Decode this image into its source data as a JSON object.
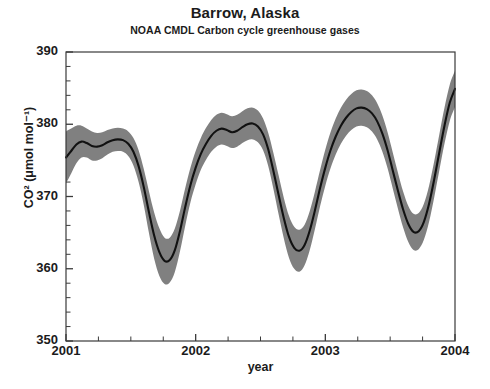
{
  "chart_data": {
    "type": "line",
    "title": "Barrow, Alaska",
    "subtitle": "NOAA CMDL Carbon cycle greenhouse gases",
    "xlabel": "year",
    "ylabel": "CO² (μmol mol⁻¹)",
    "xlim": [
      2001,
      2004
    ],
    "ylim": [
      350,
      390
    ],
    "ytick_labels": [
      "390",
      "380",
      "370",
      "360",
      "350"
    ],
    "ytick_values": [
      390,
      380,
      370,
      360,
      350
    ],
    "xtick_labels": [
      "2001",
      "2002",
      "2003",
      "2004"
    ],
    "xtick_values": [
      2001,
      2002,
      2003,
      2004
    ],
    "y_minor_step": 2,
    "x_minor_step": 0.25,
    "grid": false,
    "legend": null,
    "line_color": "#111111",
    "band_color": "#808080",
    "band_label": "uncertainty band",
    "series": [
      {
        "name": "CO2 mole fraction (smoothed curve)",
        "x": [
          2001.0,
          2001.04,
          2001.08,
          2001.12,
          2001.16,
          2001.2,
          2001.24,
          2001.28,
          2001.32,
          2001.36,
          2001.4,
          2001.44,
          2001.48,
          2001.52,
          2001.56,
          2001.6,
          2001.64,
          2001.68,
          2001.72,
          2001.76,
          2001.8,
          2001.84,
          2001.88,
          2001.92,
          2001.96,
          2002.0,
          2002.04,
          2002.08,
          2002.12,
          2002.16,
          2002.2,
          2002.24,
          2002.28,
          2002.32,
          2002.36,
          2002.4,
          2002.44,
          2002.48,
          2002.52,
          2002.56,
          2002.6,
          2002.64,
          2002.68,
          2002.72,
          2002.76,
          2002.8,
          2002.84,
          2002.88,
          2002.92,
          2002.96,
          2003.0,
          2003.04,
          2003.08,
          2003.12,
          2003.16,
          2003.2,
          2003.24,
          2003.28,
          2003.32,
          2003.36,
          2003.4,
          2003.44,
          2003.48,
          2003.52,
          2003.56,
          2003.6,
          2003.64,
          2003.68,
          2003.72,
          2003.76,
          2003.8,
          2003.84,
          2003.88,
          2003.92,
          2003.96,
          2004.0
        ],
        "y": [
          375.4,
          376.3,
          377.2,
          377.6,
          377.4,
          377.0,
          376.9,
          377.1,
          377.5,
          377.8,
          377.9,
          377.8,
          377.3,
          376.2,
          374.2,
          371.3,
          367.8,
          364.6,
          362.3,
          361.1,
          361.2,
          362.6,
          365.3,
          368.6,
          371.6,
          374.0,
          375.9,
          377.3,
          378.4,
          379.1,
          379.4,
          379.2,
          378.9,
          379.1,
          379.6,
          380.0,
          380.1,
          379.7,
          378.6,
          376.5,
          373.5,
          370.2,
          367.0,
          364.4,
          362.9,
          362.5,
          363.3,
          365.3,
          368.1,
          371.2,
          374.0,
          376.4,
          378.3,
          379.8,
          380.9,
          381.7,
          382.2,
          382.3,
          382.1,
          381.5,
          380.4,
          378.7,
          376.4,
          373.6,
          370.8,
          368.2,
          366.2,
          365.1,
          365.2,
          366.5,
          369.0,
          372.4,
          376.2,
          379.9,
          383.0,
          384.9
        ],
        "y_upper": [
          379.0,
          379.4,
          379.8,
          379.8,
          379.4,
          379.0,
          378.8,
          378.9,
          379.2,
          379.4,
          379.5,
          379.4,
          379.0,
          378.1,
          376.4,
          373.8,
          370.7,
          367.8,
          365.6,
          364.3,
          364.3,
          365.6,
          368.1,
          371.2,
          374.0,
          376.3,
          378.1,
          379.5,
          380.6,
          381.3,
          381.6,
          381.4,
          381.1,
          381.3,
          381.8,
          382.2,
          382.3,
          381.9,
          380.8,
          378.8,
          376.0,
          372.9,
          369.8,
          367.3,
          365.8,
          365.4,
          366.1,
          368.0,
          370.7,
          373.7,
          376.5,
          378.9,
          380.8,
          382.3,
          383.4,
          384.2,
          384.7,
          384.8,
          384.6,
          384.0,
          382.9,
          381.2,
          378.9,
          376.1,
          373.3,
          370.7,
          368.7,
          367.6,
          367.7,
          369.0,
          371.5,
          374.9,
          378.7,
          382.4,
          385.5,
          387.4
        ],
        "y_lower": [
          371.8,
          373.2,
          374.6,
          375.4,
          375.4,
          375.0,
          375.0,
          375.3,
          375.8,
          376.2,
          376.3,
          376.2,
          375.6,
          374.3,
          372.0,
          368.8,
          364.9,
          361.4,
          359.0,
          357.9,
          358.1,
          359.6,
          362.5,
          366.0,
          369.2,
          371.7,
          373.7,
          375.1,
          376.2,
          376.9,
          377.2,
          377.0,
          376.7,
          376.9,
          377.4,
          377.8,
          377.9,
          377.5,
          376.4,
          374.2,
          371.0,
          367.5,
          364.2,
          361.5,
          360.0,
          359.6,
          360.5,
          362.6,
          365.5,
          368.7,
          371.5,
          373.9,
          375.8,
          377.3,
          378.4,
          379.2,
          379.7,
          379.8,
          379.6,
          379.0,
          377.9,
          376.2,
          373.9,
          371.1,
          368.3,
          365.7,
          363.7,
          362.6,
          362.7,
          364.0,
          366.5,
          369.9,
          373.7,
          377.4,
          380.5,
          382.4
        ]
      }
    ],
    "annotations": {
      "cycle_minima": [
        {
          "year": 2001.76,
          "value": 361.1
        },
        {
          "year": 2002.8,
          "value": 362.5
        },
        {
          "year": 2003.72,
          "value": 365.1
        }
      ],
      "cycle_maxima": [
        {
          "year": 2001.4,
          "value": 377.9
        },
        {
          "year": 2002.44,
          "value": 380.1
        },
        {
          "year": 2003.28,
          "value": 382.3
        },
        {
          "year": 2004.0,
          "value": 384.9
        }
      ]
    }
  }
}
